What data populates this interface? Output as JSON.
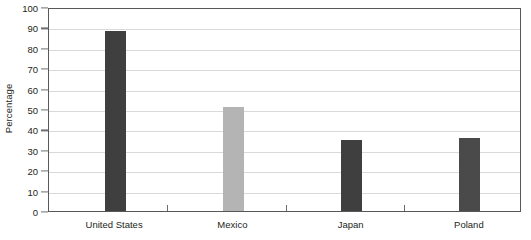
{
  "chart_data": {
    "type": "bar",
    "title": "",
    "xlabel": "",
    "ylabel": "Percentage",
    "categories": [
      "United States",
      "Mexico",
      "Japan",
      "Poland"
    ],
    "values": [
      88,
      51,
      35,
      36
    ],
    "bar_colors": [
      "#3f3f3f",
      "#b4b4b4",
      "#3f3f3f",
      "#4a4a4a"
    ],
    "ylim": [
      0,
      100
    ],
    "yticks": [
      0,
      10,
      20,
      30,
      40,
      50,
      60,
      70,
      80,
      90,
      100
    ],
    "ytick_labels": [
      "0",
      "10",
      "20",
      "30",
      "40",
      "50",
      "60",
      "70",
      "80",
      "90",
      "100"
    ],
    "grid": true,
    "legend": false,
    "series": [
      {
        "name": "Percentage",
        "values": [
          88,
          51,
          35,
          36
        ]
      }
    ]
  },
  "colors": {
    "bar_dark": "#3f3f3f",
    "bar_light": "#b4b4b4",
    "bar_poland": "#4a4a4a",
    "gridline": "#d9d9d9",
    "axis": "#58585a",
    "tick": "#6d6e70",
    "text": "#231f20",
    "background": "#ffffff"
  }
}
